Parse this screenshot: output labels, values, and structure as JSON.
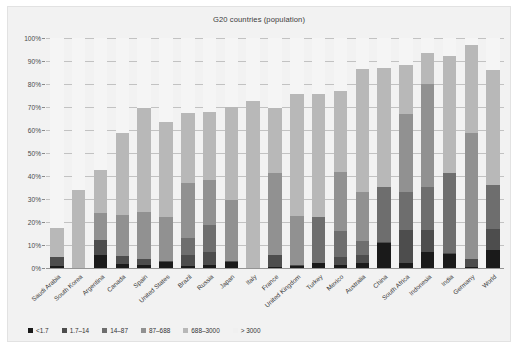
{
  "chart_data": {
    "type": "bar",
    "subtype": "stacked-bar-percent",
    "title": "G20 countries (population)",
    "xlabel": "",
    "ylabel": "",
    "ylim": [
      0,
      100
    ],
    "ytick_labels": [
      "0%",
      "10%",
      "20%",
      "30%",
      "40%",
      "50%",
      "60%",
      "70%",
      "80%",
      "90%",
      "100%"
    ],
    "ytick_values": [
      0,
      10,
      20,
      30,
      40,
      50,
      60,
      70,
      80,
      90,
      100
    ],
    "grid": true,
    "legend_position": "bottom-left",
    "categories": [
      "Saudi Arabia",
      "South Korea",
      "Argentina",
      "Canada",
      "Spain",
      "United States",
      "Brazil",
      "Russia",
      "Japan",
      "Italy",
      "France",
      "United Kingdom",
      "Turkey",
      "Mexico",
      "Australia",
      "China",
      "South Africa",
      "Indonesia",
      "India",
      "Germany",
      "World"
    ],
    "series": [
      {
        "name": "<1.7",
        "color": "#1a1a1a",
        "values": [
          1.0,
          0.0,
          5.5,
          1.8,
          1.2,
          2.6,
          1.0,
          1.5,
          2.8,
          0.0,
          0.6,
          0.8,
          2.0,
          1.3,
          2.2,
          11.0,
          2.2,
          7.0,
          6.0,
          0.5,
          8.0
        ]
      },
      {
        "name": "1.7–14",
        "color": "#4d4d4d",
        "values": [
          3.8,
          0.0,
          6.8,
          3.6,
          2.8,
          0.4,
          4.5,
          5.6,
          0.4,
          0.0,
          5.0,
          0.7,
          0.0,
          3.4,
          3.5,
          0.3,
          14.2,
          9.6,
          0.4,
          3.5,
          9.0
        ]
      },
      {
        "name": "14–87",
        "color": "#6e6e6e",
        "values": [
          0.0,
          0.0,
          0.0,
          0.0,
          0.0,
          0.0,
          7.5,
          11.8,
          0.0,
          0.0,
          0.0,
          0.0,
          20.0,
          11.6,
          5.9,
          24.0,
          16.8,
          18.8,
          35.0,
          0.0,
          19.0
        ]
      },
      {
        "name": "87–688",
        "color": "#919191",
        "values": [
          0.0,
          0.0,
          11.5,
          17.5,
          20.4,
          19.0,
          24.0,
          19.3,
          26.3,
          0.0,
          35.5,
          21.0,
          0.0,
          25.5,
          21.3,
          0.0,
          33.8,
          44.4,
          0.0,
          54.5,
          0.0
        ]
      },
      {
        "name": "688–3000",
        "color": "#b8b8b8",
        "values": [
          12.4,
          33.8,
          18.7,
          35.6,
          45.2,
          41.5,
          30.5,
          29.5,
          40.3,
          72.8,
          28.5,
          53.0,
          53.5,
          35.0,
          53.5,
          51.5,
          21.5,
          13.5,
          51.0,
          38.5,
          50.0
        ]
      },
      {
        "name": "> 3000",
        "color": "#f5f5f5",
        "values": [
          82.8,
          66.2,
          57.5,
          41.5,
          30.4,
          36.5,
          32.5,
          32.3,
          30.2,
          27.2,
          30.4,
          24.5,
          24.5,
          23.2,
          13.6,
          13.2,
          11.5,
          6.7,
          7.6,
          3.0,
          14.0
        ]
      }
    ],
    "bar_totals_visible": [
      17.2,
      33.8,
      42.5,
      58.5,
      69.6,
      63.5,
      67.5,
      67.7,
      69.8,
      72.8,
      69.6,
      75.5,
      75.5,
      76.8,
      86.4,
      86.8,
      88.5,
      93.3,
      92.4,
      97.0,
      86.0
    ]
  },
  "legend": {
    "items": [
      {
        "label": "<1.7",
        "color": "#1a1a1a"
      },
      {
        "label": "1.7–14",
        "color": "#4d4d4d"
      },
      {
        "label": "14–87",
        "color": "#6e6e6e"
      },
      {
        "label": "87–688",
        "color": "#919191"
      },
      {
        "label": "688–3000",
        "color": "#b8b8b8"
      },
      {
        "label": "> 3000",
        "color": "#f0f0f0"
      }
    ]
  },
  "colors": {
    "card_background": "#f2f2f2",
    "plot_background": "#fbfbfb",
    "gridline": "#9a9a9a",
    "text": "#3c3c3c"
  }
}
